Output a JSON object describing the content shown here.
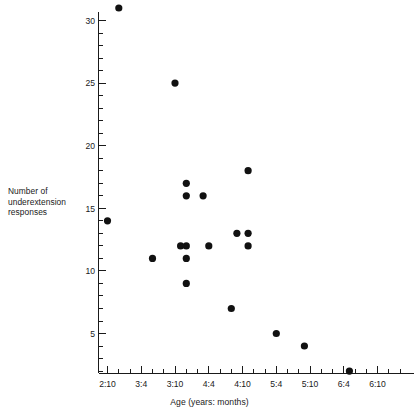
{
  "chart_data": {
    "type": "scatter",
    "title": "",
    "xlabel": "Age (years: months)",
    "ylabel": "Number of underextension responses",
    "ylabel_lines": [
      "Number of",
      "underextension",
      "responses"
    ],
    "grid": false,
    "legend": null,
    "x_tick_labels": [
      "2:10",
      "3:4",
      "3:10",
      "4:4",
      "4:10",
      "5:4",
      "5:10",
      "6:4",
      "6:10"
    ],
    "x_tick_months": [
      34,
      40,
      46,
      52,
      58,
      64,
      70,
      76,
      82
    ],
    "x_minor_interval_months": 2,
    "xlim_months": [
      34,
      86
    ],
    "y_tick_labels": [
      "5",
      "10",
      "15",
      "20",
      "25",
      "30"
    ],
    "y_tick_values": [
      5,
      10,
      15,
      20,
      25,
      30
    ],
    "y_minor_interval": 1,
    "ylim": [
      0,
      32
    ],
    "point_color": "#111111",
    "axis_color": "#1a1a1a",
    "background_color": "#ffffff",
    "points": [
      {
        "x_label": "3:0",
        "x_months": 36,
        "y": 31
      },
      {
        "x_label": "2:10",
        "x_months": 34,
        "y": 14
      },
      {
        "x_label": "3:10",
        "x_months": 46,
        "y": 25
      },
      {
        "x_label": "3:6",
        "x_months": 42,
        "y": 11
      },
      {
        "x_label": "4:0",
        "x_months": 48,
        "y": 17
      },
      {
        "x_label": "4:0",
        "x_months": 48,
        "y": 16
      },
      {
        "x_label": "4:0",
        "x_months": 48,
        "y": 12
      },
      {
        "x_label": "3:11",
        "x_months": 47,
        "y": 12
      },
      {
        "x_label": "4:0",
        "x_months": 48,
        "y": 11
      },
      {
        "x_label": "4:0",
        "x_months": 48,
        "y": 9
      },
      {
        "x_label": "4:3",
        "x_months": 51,
        "y": 16
      },
      {
        "x_label": "4:4",
        "x_months": 52,
        "y": 12
      },
      {
        "x_label": "4:8",
        "x_months": 56,
        "y": 7
      },
      {
        "x_label": "4:9",
        "x_months": 57,
        "y": 13
      },
      {
        "x_label": "4:11",
        "x_months": 59,
        "y": 18
      },
      {
        "x_label": "4:11",
        "x_months": 59,
        "y": 13
      },
      {
        "x_label": "4:11",
        "x_months": 59,
        "y": 12
      },
      {
        "x_label": "5:4",
        "x_months": 64,
        "y": 5
      },
      {
        "x_label": "5:9",
        "x_months": 69,
        "y": 4
      },
      {
        "x_label": "6:5",
        "x_months": 77,
        "y": 2
      }
    ]
  },
  "axis_titles": {
    "x": "Age (years: months)",
    "y_line1": "Number of",
    "y_line2": "underextension",
    "y_line3": "responses"
  }
}
